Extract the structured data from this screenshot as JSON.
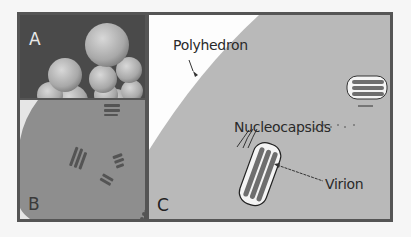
{
  "figure": {
    "panels": [
      {
        "id": "A",
        "letter": "A",
        "content": "micrograph of clustered polyhedra"
      },
      {
        "id": "B",
        "letter": "B",
        "content": "micrograph of virions within polyhedron"
      },
      {
        "id": "C",
        "letter": "C",
        "content": "schematic of polyhedron"
      }
    ],
    "labels": {
      "polyhedron": "Polyhedron",
      "nucleocapsids": "Nucleocapsids",
      "virion": "Virion"
    },
    "colors": {
      "frame": "#555555",
      "panel_a_bg": "#4a4a4a",
      "sphere": "#b4b4b4",
      "panel_b_bg": "#8e8e8e",
      "polyhedron_fill": "#b8b8b8",
      "virion_rod": "#6e6e6e",
      "text": "#2a2a2a"
    }
  }
}
